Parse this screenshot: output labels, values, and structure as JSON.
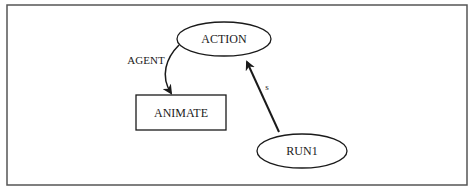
{
  "diagram": {
    "frame": {
      "stroke": "#555555"
    },
    "nodes": [
      {
        "id": "action",
        "label": "ACTION",
        "shape": "ellipse"
      },
      {
        "id": "animate",
        "label": "ANIMATE",
        "shape": "rectangle"
      },
      {
        "id": "run1",
        "label": "RUN1",
        "shape": "ellipse"
      }
    ],
    "edges": [
      {
        "from": "action",
        "to": "animate",
        "label": "AGENT",
        "style": "curved"
      },
      {
        "from": "run1",
        "to": "action",
        "label": "s",
        "style": "straight"
      }
    ],
    "colors": {
      "stroke": "#1a1a1a",
      "background": "#ffffff"
    }
  }
}
